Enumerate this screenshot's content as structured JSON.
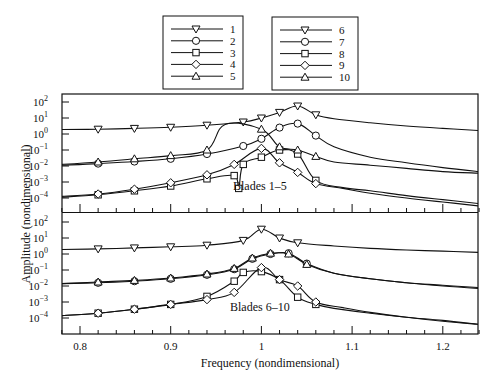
{
  "chart_data": {
    "type": "line",
    "xlabel": "Frequency (nondimensional)",
    "ylabel": "Amplitude (nondimensional)",
    "xlim": [
      0.78,
      1.24
    ],
    "xticks": [
      0.8,
      0.9,
      1,
      1.1,
      1.2
    ],
    "xtick_labels": [
      "0.8",
      "0.9",
      "1",
      "1.1",
      "1.2"
    ],
    "yscale": "log",
    "ylim": [
      1e-05,
      1000.0
    ],
    "ytick_labels": [
      "10^2",
      "10^1",
      "10^0",
      "10^-1",
      "10^-2",
      "10^-3",
      "10^-4"
    ],
    "grid": false,
    "legend": {
      "position": "top-center",
      "columns": [
        [
          {
            "label": "1",
            "marker": "triangle-down"
          },
          {
            "label": "2",
            "marker": "circle"
          },
          {
            "label": "3",
            "marker": "square"
          },
          {
            "label": "4",
            "marker": "diamond"
          },
          {
            "label": "5",
            "marker": "triangle-up"
          }
        ],
        [
          {
            "label": "6",
            "marker": "triangle-down"
          },
          {
            "label": "7",
            "marker": "circle"
          },
          {
            "label": "8",
            "marker": "square"
          },
          {
            "label": "9",
            "marker": "diamond"
          },
          {
            "label": "10",
            "marker": "triangle-up"
          }
        ]
      ]
    },
    "panels": [
      {
        "annotation": "Blades 1–5",
        "series": [
          {
            "name": "1",
            "marker": "triangle-down",
            "x": [
              0.78,
              0.82,
              0.86,
              0.9,
              0.94,
              0.98,
              1.0,
              1.02,
              1.04,
              1.06,
              1.08,
              1.12,
              1.16,
              1.2,
              1.24
            ],
            "log10": [
              0.28,
              0.3,
              0.35,
              0.42,
              0.55,
              0.75,
              1.0,
              1.35,
              1.75,
              1.2,
              0.95,
              0.7,
              0.5,
              0.35,
              0.22
            ]
          },
          {
            "name": "2",
            "marker": "circle",
            "x": [
              0.78,
              0.82,
              0.86,
              0.9,
              0.94,
              0.98,
              1.0,
              1.02,
              1.04,
              1.06,
              1.08,
              1.12,
              1.16,
              1.2,
              1.24
            ],
            "log10": [
              -1.95,
              -1.85,
              -1.72,
              -1.55,
              -1.25,
              -0.75,
              -0.3,
              0.4,
              0.65,
              -0.1,
              -0.8,
              -1.45,
              -1.8,
              -2.1,
              -2.35
            ]
          },
          {
            "name": "3",
            "marker": "square",
            "x": [
              0.78,
              0.82,
              0.86,
              0.9,
              0.94,
              0.97,
              0.975,
              0.98,
              1.0,
              1.02,
              1.04,
              1.06,
              1.09,
              1.12,
              1.16,
              1.2,
              1.24
            ],
            "log10": [
              -3.95,
              -3.8,
              -3.55,
              -3.25,
              -2.8,
              -2.6,
              -3.4,
              -1.9,
              -1.45,
              -1.0,
              -1.25,
              -2.9,
              -3.35,
              -3.55,
              -3.85,
              -4.1,
              -4.35
            ]
          },
          {
            "name": "4",
            "marker": "diamond",
            "x": [
              0.78,
              0.82,
              0.86,
              0.9,
              0.94,
              0.97,
              1.0,
              1.02,
              1.04,
              1.06,
              1.09,
              1.12,
              1.16,
              1.2,
              1.24
            ],
            "log10": [
              -3.9,
              -3.75,
              -3.45,
              -3.05,
              -2.55,
              -1.9,
              -0.9,
              -1.8,
              -2.4,
              -3.1,
              -3.4,
              -3.7,
              -4.0,
              -4.25,
              -4.5
            ]
          },
          {
            "name": "5",
            "marker": "triangle-up",
            "x": [
              0.78,
              0.82,
              0.86,
              0.9,
              0.94,
              0.96,
              1.0,
              1.02,
              1.04,
              1.06,
              1.08,
              1.12,
              1.16,
              1.2,
              1.24
            ],
            "log10": [
              -1.9,
              -1.75,
              -1.55,
              -1.35,
              -1.0,
              0.6,
              0.3,
              -0.8,
              -1.0,
              -1.4,
              -1.75,
              -1.95,
              -2.15,
              -2.35,
              -2.45
            ]
          }
        ]
      },
      {
        "annotation": "Blades 6–10",
        "series": [
          {
            "name": "6",
            "marker": "triangle-down",
            "x": [
              0.78,
              0.82,
              0.86,
              0.9,
              0.94,
              0.98,
              1.0,
              1.02,
              1.04,
              1.08,
              1.12,
              1.16,
              1.2,
              1.24
            ],
            "log10": [
              0.28,
              0.32,
              0.38,
              0.45,
              0.55,
              0.85,
              1.55,
              1.0,
              0.7,
              0.5,
              0.35,
              0.25,
              0.18,
              0.1
            ]
          },
          {
            "name": "7",
            "marker": "circle",
            "x": [
              0.78,
              0.82,
              0.86,
              0.9,
              0.94,
              0.97,
              0.99,
              1.01,
              1.03,
              1.05,
              1.08,
              1.12,
              1.16,
              1.2,
              1.24
            ],
            "log10": [
              -1.85,
              -1.8,
              -1.7,
              -1.55,
              -1.3,
              -0.95,
              -0.3,
              0.0,
              0.05,
              -0.6,
              -1.2,
              -1.55,
              -1.8,
              -2.0,
              -2.15
            ]
          },
          {
            "name": "8",
            "marker": "square",
            "x": [
              0.78,
              0.82,
              0.86,
              0.9,
              0.94,
              0.97,
              0.98,
              1.0,
              1.02,
              1.04,
              1.06,
              1.08,
              1.12,
              1.16,
              1.2,
              1.24
            ],
            "log10": [
              -3.85,
              -3.7,
              -3.45,
              -3.15,
              -2.65,
              -1.7,
              -1.15,
              -1.1,
              -1.6,
              -2.7,
              -3.15,
              -3.4,
              -3.7,
              -3.95,
              -4.15,
              -4.4
            ]
          },
          {
            "name": "9",
            "marker": "diamond",
            "x": [
              0.78,
              0.82,
              0.86,
              0.9,
              0.94,
              0.97,
              1.0,
              1.02,
              1.04,
              1.06,
              1.09,
              1.12,
              1.16,
              1.2,
              1.24
            ],
            "log10": [
              -3.85,
              -3.7,
              -3.45,
              -3.15,
              -2.85,
              -2.4,
              -0.85,
              -1.6,
              -2.0,
              -3.0,
              -3.35,
              -3.65,
              -3.95,
              -4.2,
              -4.4
            ]
          },
          {
            "name": "10",
            "marker": "triangle-up",
            "x": [
              0.78,
              0.82,
              0.86,
              0.9,
              0.94,
              0.97,
              0.99,
              1.01,
              1.03,
              1.05,
              1.08,
              1.12,
              1.16,
              1.2,
              1.24
            ],
            "log10": [
              -1.85,
              -1.75,
              -1.65,
              -1.5,
              -1.25,
              -0.9,
              -0.25,
              0.05,
              0.0,
              -0.65,
              -1.2,
              -1.55,
              -1.8,
              -1.95,
              -2.1
            ]
          }
        ]
      }
    ]
  },
  "labels": {
    "xlabel": "Frequency (nondimensional)",
    "ylabel": "Amplitude (nondimensional)",
    "panel_top_annotation": "Blades 1–5",
    "panel_bottom_annotation": "Blades 6–10"
  }
}
